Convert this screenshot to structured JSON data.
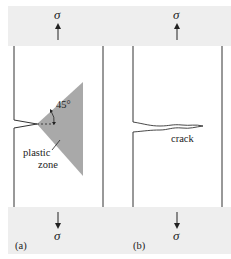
{
  "figure": {
    "panel_a": {
      "label": "(a)",
      "angle_label": "45°",
      "zone_label_line1": "plastic",
      "zone_label_line2": "zone",
      "stress_top": "σ",
      "stress_bottom": "σ"
    },
    "panel_b": {
      "label": "(b)",
      "crack_label": "crack",
      "stress_top": "σ",
      "stress_bottom": "σ"
    },
    "colors": {
      "band": "#eeeeee",
      "plastic_zone": "#a9a9a9",
      "line": "#333333"
    }
  }
}
